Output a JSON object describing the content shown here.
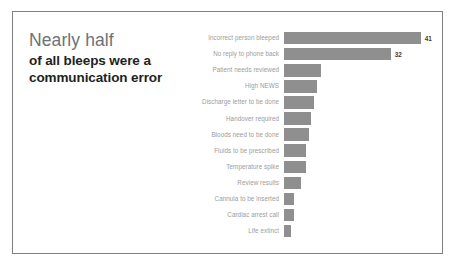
{
  "slide": {
    "title_lead": "Nearly half",
    "title_rest": "of all bleeps were a communication error"
  },
  "chart_data": {
    "type": "bar",
    "orientation": "horizontal",
    "title": "Nearly half of all bleeps were a communication error",
    "subtitle": "",
    "xlabel": "",
    "ylabel": "",
    "grid": false,
    "legend": null,
    "axis_visible": false,
    "xlim": [
      0,
      45
    ],
    "bar_color": "#8f8f8f",
    "label_color": "#9b9b9b",
    "categories": [
      "Incorrect person bleeped",
      "No reply to phone back",
      "Patient needs reviewed",
      "High NEWS",
      "Discharge letter to be done",
      "Handover required",
      "Bloods need to be done",
      "Fluids to be prescribed",
      "Temperature spike",
      "Review results",
      "Cannula to be inserted",
      "Cardiac arrest call",
      "Life extinct"
    ],
    "values": [
      41,
      32,
      11,
      10,
      9,
      8,
      7.5,
      6.5,
      6.5,
      5,
      3,
      3,
      2
    ],
    "data_labels": [
      "41",
      "32",
      "",
      "",
      "",
      "",
      "",
      "",
      "",
      "",
      "",
      "",
      ""
    ]
  }
}
